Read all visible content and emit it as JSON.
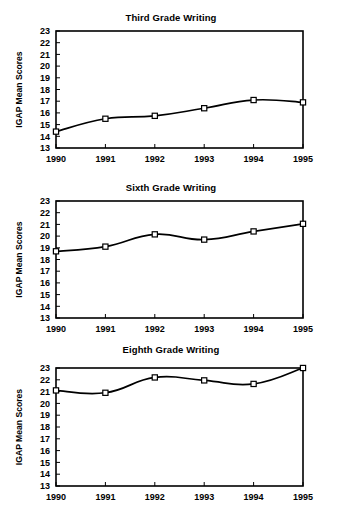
{
  "chart_data": [
    {
      "type": "line",
      "title": "Third Grade Writing",
      "xlabel": "",
      "ylabel": "IGAP Mean Scores",
      "categories": [
        "1990",
        "1991",
        "1992",
        "1993",
        "1994",
        "1995"
      ],
      "values": [
        14.4,
        15.5,
        15.75,
        16.4,
        17.1,
        16.9
      ],
      "ylim": [
        13,
        23
      ],
      "yticks": [
        13,
        14,
        15,
        16,
        17,
        18,
        19,
        20,
        21,
        22,
        23
      ],
      "ytick_labels": [
        "13",
        "14",
        "15",
        "16",
        "17",
        "18",
        "19",
        "20",
        "21",
        "22",
        "23"
      ],
      "grid": false,
      "legend": false,
      "marker": "open-square",
      "line_color": "#000000",
      "marker_fill": "#ffffff"
    },
    {
      "type": "line",
      "title": "Sixth Grade Writing",
      "xlabel": "",
      "ylabel": "IGAP Mean Scores",
      "categories": [
        "1990",
        "1991",
        "1992",
        "1993",
        "1994",
        "1995"
      ],
      "values": [
        18.7,
        19.1,
        20.15,
        19.7,
        20.4,
        21.05
      ],
      "ylim": [
        13,
        23
      ],
      "yticks": [
        13,
        14,
        15,
        16,
        17,
        18,
        19,
        20,
        21,
        22,
        23
      ],
      "ytick_labels": [
        "13",
        "14",
        "15",
        "16",
        "17",
        "18",
        "19",
        "20",
        "21",
        "22",
        "23"
      ],
      "grid": false,
      "legend": false,
      "marker": "open-square",
      "line_color": "#000000",
      "marker_fill": "#ffffff"
    },
    {
      "type": "line",
      "title": "Eighth Grade Writing",
      "xlabel": "",
      "ylabel": "IGAP Mean Scores",
      "categories": [
        "1990",
        "1991",
        "1992",
        "1993",
        "1994",
        "1995"
      ],
      "values": [
        21.1,
        20.9,
        22.2,
        21.95,
        21.65,
        23.0
      ],
      "ylim": [
        13,
        23
      ],
      "yticks": [
        13,
        14,
        15,
        16,
        17,
        18,
        19,
        20,
        21,
        22,
        23
      ],
      "ytick_labels": [
        "13",
        "14",
        "15",
        "16",
        "17",
        "18",
        "19",
        "20",
        "21",
        "22",
        "23"
      ],
      "grid": false,
      "legend": false,
      "marker": "open-square",
      "line_color": "#000000",
      "marker_fill": "#ffffff"
    }
  ]
}
